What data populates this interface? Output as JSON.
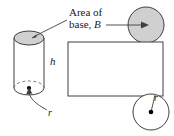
{
  "figure": {
    "title_text_line1": "Area of",
    "title_text_line2_prefix": "base, ",
    "title_text_line2_symbol": "B",
    "height_label": "h",
    "radius_label_cylinder": "r",
    "radius_label_circle": "r",
    "colors": {
      "stroke": "#3f3f3f",
      "shaded_fill": "#d0d0d0",
      "plain_fill": "#ffffff",
      "text": "#1a1a1a",
      "dot": "#000000"
    },
    "shapes": {
      "cylinder": {
        "name": "cylinder",
        "left": 14,
        "right": 44,
        "top_ellipse_cy": 38,
        "bottom_ellipse_cy": 88,
        "rx": 15,
        "ry": 7,
        "top_shaded": true
      },
      "base_circle_top": {
        "name": "shaded-base-circle",
        "cx": 146,
        "cy": 25,
        "r": 18,
        "shaded": true
      },
      "lateral_rectangle": {
        "name": "lateral-surface-rectangle",
        "x": 68,
        "y": 42,
        "width": 95,
        "height": 54,
        "shaded": false
      },
      "base_circle_bottom": {
        "name": "bottom-base-circle",
        "cx": 151,
        "cy": 112,
        "r": 18,
        "shaded": false
      }
    }
  }
}
